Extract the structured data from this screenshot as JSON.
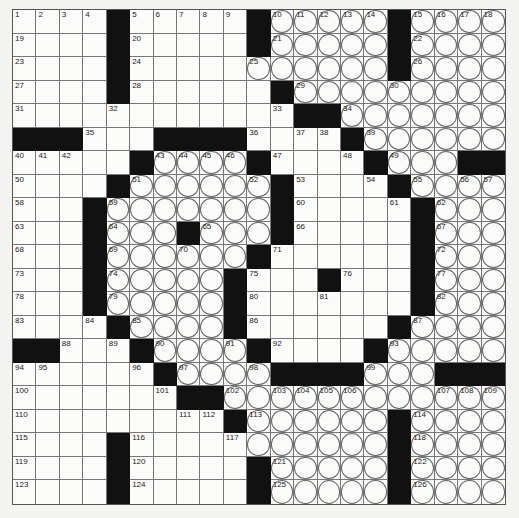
{
  "puzzle": {
    "size": 21,
    "legend": {
      "#": "black-square",
      ".": "white-square",
      "o": "circled-square"
    },
    "rows": [
      "....#.....#ooooo#oooo",
      "....#.....#ooooo#oooo",
      "....#.....oooooo#oooo",
      "....#......#ooooooooo",
      "............##ooooooo",
      "###...####....#oooooo",
      ".....#oooo#....#ooo##",
      "....#oooooo#....#oooo",
      "...#ooooooo#.....#ooo",
      "...#ooo#ooo#.....#ooo",
      "...#oooooo#......#ooo",
      "...#ooooo#...#...#ooo",
      "...#ooooo#.......#ooo",
      "....#oooo#......#oooo",
      "##...#oooo#....#ooooo",
      "......#oooo####ooo###",
      ".......##oooooooooooo",
      ".........#oooooo#oooo",
      "....#.....oooooo#oooo",
      "....#.....#ooooo#oooo",
      "....#.....#ooooo#oooo"
    ],
    "numbers": [
      [
        [
          0,
          1
        ],
        [
          1,
          2
        ],
        [
          2,
          3
        ],
        [
          3,
          4
        ],
        [
          5,
          5
        ],
        [
          6,
          6
        ],
        [
          7,
          7
        ],
        [
          8,
          8
        ],
        [
          9,
          9
        ],
        [
          11,
          10
        ],
        [
          12,
          11
        ],
        [
          13,
          12
        ],
        [
          14,
          13
        ],
        [
          15,
          14
        ],
        [
          17,
          15
        ],
        [
          18,
          16
        ],
        [
          19,
          17
        ],
        [
          20,
          18
        ]
      ],
      [
        [
          0,
          19
        ],
        [
          5,
          20
        ],
        [
          11,
          21
        ],
        [
          17,
          22
        ]
      ],
      [
        [
          0,
          23
        ],
        [
          5,
          24
        ],
        [
          10,
          25
        ],
        [
          17,
          26
        ]
      ],
      [
        [
          0,
          27
        ],
        [
          5,
          28
        ],
        [
          12,
          29
        ],
        [
          16,
          30
        ]
      ],
      [
        [
          0,
          31
        ],
        [
          4,
          32
        ],
        [
          11,
          33
        ],
        [
          14,
          34
        ]
      ],
      [
        [
          3,
          35
        ],
        [
          10,
          36
        ],
        [
          12,
          37
        ],
        [
          13,
          38
        ],
        [
          15,
          39
        ]
      ],
      [
        [
          0,
          40
        ],
        [
          1,
          41
        ],
        [
          2,
          42
        ],
        [
          6,
          43
        ],
        [
          7,
          44
        ],
        [
          8,
          45
        ],
        [
          9,
          46
        ],
        [
          11,
          47
        ],
        [
          14,
          48
        ],
        [
          16,
          49
        ]
      ],
      [
        [
          0,
          50
        ],
        [
          5,
          51
        ],
        [
          10,
          52
        ],
        [
          12,
          53
        ],
        [
          15,
          54
        ],
        [
          17,
          55
        ],
        [
          19,
          56
        ],
        [
          20,
          57
        ]
      ],
      [
        [
          0,
          58
        ],
        [
          4,
          59
        ],
        [
          12,
          60
        ],
        [
          16,
          61
        ],
        [
          18,
          62
        ]
      ],
      [
        [
          0,
          63
        ],
        [
          4,
          64
        ],
        [
          8,
          65
        ],
        [
          12,
          66
        ],
        [
          18,
          67
        ]
      ],
      [
        [
          0,
          68
        ],
        [
          4,
          69
        ],
        [
          7,
          70
        ],
        [
          11,
          71
        ],
        [
          18,
          72
        ]
      ],
      [
        [
          0,
          73
        ],
        [
          4,
          74
        ],
        [
          10,
          75
        ],
        [
          14,
          76
        ],
        [
          18,
          77
        ]
      ],
      [
        [
          0,
          78
        ],
        [
          4,
          79
        ],
        [
          10,
          80
        ],
        [
          13,
          81
        ],
        [
          18,
          82
        ]
      ],
      [
        [
          0,
          83
        ],
        [
          3,
          84
        ],
        [
          5,
          85
        ],
        [
          10,
          86
        ],
        [
          17,
          87
        ]
      ],
      [
        [
          2,
          88
        ],
        [
          4,
          89
        ],
        [
          6,
          90
        ],
        [
          9,
          91
        ],
        [
          11,
          92
        ],
        [
          16,
          93
        ]
      ],
      [
        [
          0,
          94
        ],
        [
          1,
          95
        ],
        [
          5,
          96
        ],
        [
          7,
          97
        ],
        [
          10,
          98
        ],
        [
          15,
          99
        ]
      ],
      [
        [
          0,
          100
        ],
        [
          6,
          101
        ],
        [
          9,
          102
        ],
        [
          11,
          103
        ],
        [
          12,
          104
        ],
        [
          13,
          105
        ],
        [
          14,
          106
        ],
        [
          18,
          107
        ],
        [
          19,
          108
        ],
        [
          20,
          109
        ]
      ],
      [
        [
          0,
          110
        ],
        [
          7,
          111
        ],
        [
          8,
          112
        ],
        [
          10,
          113
        ],
        [
          17,
          114
        ]
      ],
      [
        [
          0,
          115
        ],
        [
          5,
          116
        ],
        [
          9,
          117
        ],
        [
          17,
          118
        ]
      ],
      [
        [
          0,
          119
        ],
        [
          5,
          120
        ],
        [
          11,
          121
        ],
        [
          17,
          122
        ]
      ],
      [
        [
          0,
          123
        ],
        [
          5,
          124
        ],
        [
          11,
          125
        ],
        [
          17,
          126
        ]
      ]
    ]
  }
}
